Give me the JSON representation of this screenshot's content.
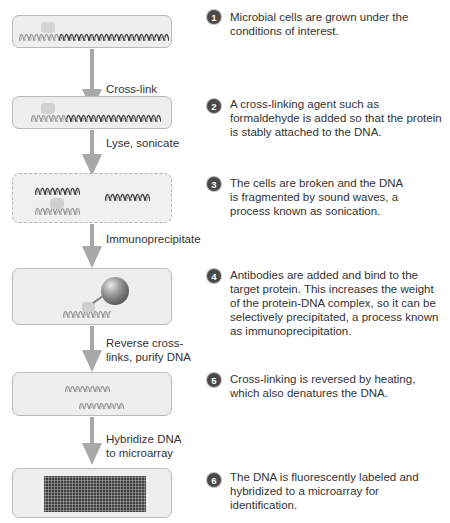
{
  "colors": {
    "box_fill": "#eeeeee",
    "box_border": "#b9b9b9",
    "arrow": "#a8a8a8",
    "badge": "#4a4a4a",
    "dna_dark": "#3a3a3a",
    "dna_light": "#9a9a9a",
    "protein": "#d0d0d0",
    "antibody": "#6a6a6a"
  },
  "steps": [
    {
      "number": "1",
      "description": "Microbial cells are grown under the conditions of interest."
    },
    {
      "number": "2",
      "description": "A cross-linking agent such as formaldehyde is added so that the protein is stably attached to the DNA."
    },
    {
      "number": "3",
      "description": "The cells are broken and the DNA is fragmented by sound waves, a process known as sonication."
    },
    {
      "number": "4",
      "description": "Antibodies are added and bind to the target protein. This increases the weight of the protein-DNA complex, so it can be selectively precipitated, a process known as immunoprecipitation."
    },
    {
      "number": "5",
      "description": "Cross-linking is reversed by heating, which also denatures the DNA."
    },
    {
      "number": "6",
      "description": "The DNA is fluorescently labeled and hybridized to a microarray for identification."
    }
  ],
  "transitions": [
    {
      "label": "Cross-link"
    },
    {
      "label": "Lyse, sonicate"
    },
    {
      "label": "Immunoprecipitate"
    },
    {
      "label": "Reverse cross-links, purify DNA"
    },
    {
      "label": "Hybridize DNA to microarray"
    }
  ],
  "icons": {
    "dna": "dna-helix-icon",
    "protein": "protein-blob-icon",
    "antibody": "antibody-bead-icon",
    "microarray": "microarray-chip-icon"
  }
}
